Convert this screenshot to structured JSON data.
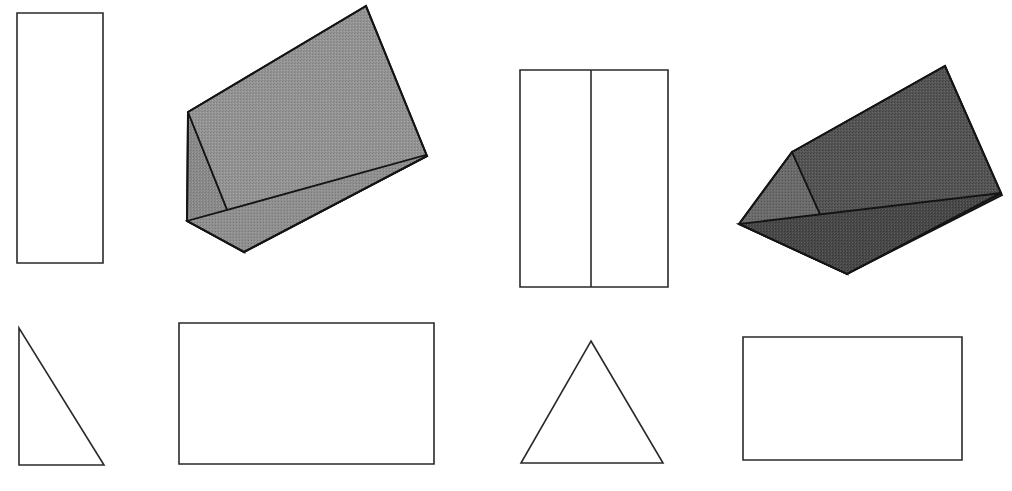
{
  "figure": {
    "background_color": "#ffffff",
    "outline_color": "#2a2a2a",
    "canvas": {
      "width": 1012,
      "height": 491
    },
    "groups": [
      {
        "id": "group-left",
        "label": "Left prism group",
        "shapes": [
          "rect-tall-left",
          "prism-light",
          "triangle-right-scalene",
          "rect-wide-left"
        ]
      },
      {
        "id": "group-right",
        "label": "Right prism group",
        "shapes": [
          "rect-split-two-panels",
          "prism-dark",
          "triangle-isosceles",
          "rect-wide-right"
        ]
      }
    ],
    "shapes": [
      {
        "id": "rect-tall-left",
        "name": "tall-rectangle",
        "type": "rectangle",
        "fill": "#ffffff",
        "stroke": "#2a2a2a",
        "x": 17,
        "y": 13,
        "width": 86,
        "height": 250,
        "points": "17,13 103,13 103,263 17,263"
      },
      {
        "id": "prism-light",
        "name": "light-triangular-prism",
        "type": "triangular-prism",
        "orientation": "tilted-up-right",
        "faces": [
          {
            "id": "prism-light-left-face",
            "name": "left-triangular-face",
            "fill": "#8e8e8e",
            "points": "188,112 187,221 244,252"
          },
          {
            "id": "prism-light-top-face",
            "name": "upper-rectangular-face",
            "fill": "#9a9a9a",
            "points": "188,112 366,6 427,156 244,252"
          },
          {
            "id": "prism-light-front-face",
            "name": "front-rectangular-face",
            "fill": "#8a8a8a",
            "points": "187,221 244,252 427,156 426,155"
          }
        ],
        "outline_points": "188,112 366,6 427,156 244,252 187,221"
      },
      {
        "id": "triangle-right-scalene",
        "name": "right-triangle",
        "type": "triangle",
        "fill": "#ffffff",
        "stroke": "#2a2a2a",
        "points": "19,328 19,465 104,465"
      },
      {
        "id": "rect-wide-left",
        "name": "wide-rectangle-left",
        "type": "rectangle",
        "fill": "#ffffff",
        "stroke": "#2a2a2a",
        "x": 179,
        "y": 323,
        "width": 255,
        "height": 141,
        "points": "179,323 434,323 434,464 179,464"
      },
      {
        "id": "rect-split-two-panels",
        "name": "split-rectangle",
        "type": "rectangle-with-divider",
        "fill": "#ffffff",
        "stroke": "#2a2a2a",
        "x": 520,
        "y": 70,
        "width": 148,
        "height": 217,
        "divider_x": 591,
        "points": "520,70 668,70 668,287 520,287"
      },
      {
        "id": "prism-dark",
        "name": "dark-triangular-prism",
        "type": "triangular-prism",
        "orientation": "tilted-up-right",
        "faces": [
          {
            "id": "prism-dark-left-face",
            "name": "left-triangular-face",
            "fill": "#6f6f6f",
            "points": "792,152 739,224 847,274"
          },
          {
            "id": "prism-dark-top-face",
            "name": "upper-rectangular-face",
            "fill": "#595959",
            "points": "792,152 945,66 1001,193 847,274"
          },
          {
            "id": "prism-dark-front-face",
            "name": "front-rectangular-face",
            "fill": "#4a4a4a",
            "points": "739,224 847,274 1002,195 1001,193"
          }
        ],
        "outline_points": "792,152 945,66 1001,193 847,274 739,224"
      },
      {
        "id": "triangle-isosceles",
        "name": "isosceles-triangle",
        "type": "triangle",
        "fill": "#ffffff",
        "stroke": "#2a2a2a",
        "points": "591,341 663,463 521,463"
      },
      {
        "id": "rect-wide-right",
        "name": "wide-rectangle-right",
        "type": "rectangle",
        "fill": "#ffffff",
        "stroke": "#2a2a2a",
        "x": 743,
        "y": 337,
        "width": 219,
        "height": 123,
        "points": "743,337 962,337 962,460 743,460"
      }
    ]
  }
}
